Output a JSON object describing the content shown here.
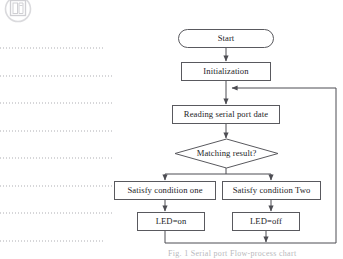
{
  "page": {
    "type": "scanned-document-page",
    "background_color": "#ffffff",
    "line_color": "#59595e",
    "text_color": "#1d1d1f"
  },
  "watermark": {
    "name": "publisher-logo-watermark",
    "visible": true
  },
  "text_remnants": {
    "description": "faint dotted horizontal lines from scanned body text",
    "line_tops": [
      47,
      75,
      102,
      130,
      157,
      185,
      212,
      240
    ],
    "widths": [
      105,
      113,
      113,
      113,
      113,
      113,
      113,
      105
    ]
  },
  "flowchart": {
    "title": "Serial port LED control flowchart",
    "nodes": [
      {
        "id": "start",
        "label": "Start",
        "shape": "terminal",
        "x": 178,
        "y": 29,
        "w": 96,
        "h": 19
      },
      {
        "id": "init",
        "label": "Initialization",
        "shape": "process",
        "x": 181,
        "y": 62,
        "w": 90,
        "h": 19
      },
      {
        "id": "read",
        "label": "Reading serial port date",
        "shape": "process",
        "x": 172,
        "y": 105,
        "w": 108,
        "h": 19
      },
      {
        "id": "decide",
        "label": "Matching result?",
        "shape": "decision",
        "x": 175,
        "y": 139,
        "w": 103,
        "h": 29
      },
      {
        "id": "cond1",
        "label": "Satisfy condition one",
        "shape": "process",
        "x": 114,
        "y": 181,
        "w": 102,
        "h": 19
      },
      {
        "id": "cond2",
        "label": "Satisfy condition Two",
        "shape": "process",
        "x": 222,
        "y": 181,
        "w": 99,
        "h": 19
      },
      {
        "id": "ledon",
        "label": "LED=on",
        "shape": "process",
        "x": 137,
        "y": 212,
        "w": 68,
        "h": 19
      },
      {
        "id": "ledoff",
        "label": "LED=off",
        "shape": "process",
        "x": 232,
        "y": 212,
        "w": 68,
        "h": 19
      }
    ],
    "edges": [
      {
        "from": "start",
        "to": "init",
        "type": "arrow"
      },
      {
        "from": "init",
        "to": "read",
        "type": "arrow"
      },
      {
        "from": "read",
        "to": "decide",
        "type": "arrow"
      },
      {
        "from": "decide",
        "to": "cond1",
        "type": "branch-arrow"
      },
      {
        "from": "decide",
        "to": "cond2",
        "type": "branch-arrow"
      },
      {
        "from": "cond1",
        "to": "ledon",
        "type": "arrow"
      },
      {
        "from": "cond2",
        "to": "ledoff",
        "type": "arrow"
      },
      {
        "from": "ledon",
        "to": "merge",
        "type": "line"
      },
      {
        "from": "ledoff",
        "to": "merge",
        "type": "arrow"
      },
      {
        "from": "merge",
        "to": "read",
        "type": "feedback-loop-arrow"
      }
    ]
  },
  "caption": {
    "text": "Fig. 1  Serial port Flow-process chart",
    "clipped": true
  }
}
